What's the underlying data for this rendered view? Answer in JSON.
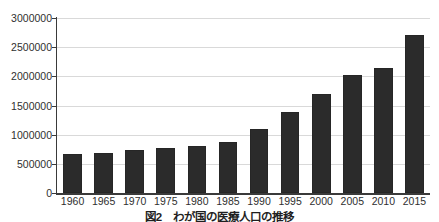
{
  "chart_data": {
    "type": "bar",
    "title": "",
    "xlabel": "",
    "ylabel": "",
    "categories": [
      "1960",
      "1965",
      "1970",
      "1975",
      "1980",
      "1985",
      "1990",
      "1995",
      "2000",
      "2005",
      "2010",
      "2015"
    ],
    "values": [
      670000,
      690000,
      740000,
      780000,
      810000,
      880000,
      1090000,
      1390000,
      1700000,
      2030000,
      2140000,
      2710000
    ],
    "ylim": [
      0,
      3000000
    ],
    "yticks": [
      0,
      500000,
      1000000,
      1500000,
      2000000,
      2500000,
      3000000
    ],
    "ytick_labels": [
      "0",
      "500000",
      "1000000",
      "1500000",
      "2000000",
      "2500000",
      "3000000"
    ],
    "grid": "horizontal",
    "legend": "none",
    "bar_color": "#2b2b2b",
    "gridline_color": "#d9d9d9",
    "axis_color": "#3a3a3a"
  },
  "caption": {
    "text": "図2　わが国の医療人口の推移",
    "note_clipped": "true"
  }
}
